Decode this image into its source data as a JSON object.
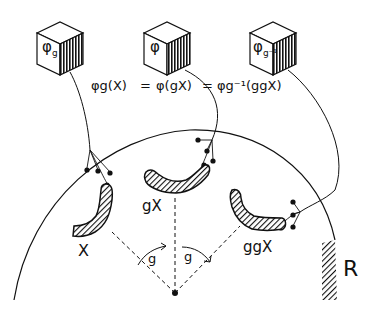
{
  "diagram": {
    "cubes": [
      {
        "id": "left",
        "symbol": "φ",
        "subscript": "g",
        "label": "φ_g"
      },
      {
        "id": "center",
        "symbol": "φ",
        "subscript": "",
        "label": "φ"
      },
      {
        "id": "right",
        "symbol": "φ",
        "subscript": "g⁻¹",
        "label": "φ_g⁻¹"
      }
    ],
    "equation": {
      "part1": "φg(X)",
      "eq1": "=",
      "part2": "φ(gX)",
      "eq2": "=",
      "part3": "φg⁻¹(ggX)"
    },
    "shapes": [
      {
        "id": "x",
        "label": "X"
      },
      {
        "id": "gx",
        "label": "gX"
      },
      {
        "id": "ggx",
        "label": "ggX"
      }
    ],
    "angles": [
      {
        "label": "g"
      },
      {
        "label": "g"
      }
    ],
    "region_label": "R",
    "colors": {
      "ink": "#111111",
      "background": "#ffffff"
    }
  }
}
